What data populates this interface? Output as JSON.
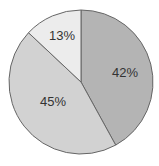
{
  "chart_data": {
    "type": "pie",
    "title": "",
    "categories": [
      "Slice A",
      "Slice B",
      "Slice C"
    ],
    "values": [
      42,
      45,
      13
    ],
    "labels": [
      "42%",
      "45%",
      "13%"
    ],
    "colors": [
      "#b4b4b4",
      "#d2d2d2",
      "#ececec"
    ],
    "start_angle": "12 o'clock",
    "direction": "clockwise",
    "legend": "none"
  },
  "style": {
    "stroke": "#666666",
    "background": "#ffffff"
  }
}
